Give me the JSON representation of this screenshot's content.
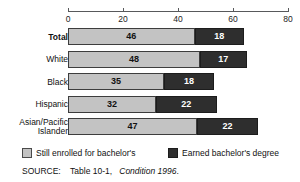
{
  "top_clipped_text": "",
  "chart_data": {
    "type": "bar",
    "orientation": "horizontal",
    "stacked": true,
    "title": "",
    "xlabel": "",
    "ylabel": "",
    "xlim": [
      0,
      80
    ],
    "grid": false,
    "xticks": [
      0,
      20,
      40,
      60,
      80
    ],
    "xtick_labels": [
      "0",
      "20",
      "40",
      "60",
      "80"
    ],
    "categories": [
      "Total",
      "White",
      "Black",
      "Hispanic",
      "Asian/Pacific Islander"
    ],
    "category_display": [
      "Total",
      "White",
      "Black",
      "Hispanic",
      "Asian/Pacific\nIslander"
    ],
    "series": [
      {
        "name": "Still enrolled for bachelor's",
        "color": "#c3c3c3",
        "values": [
          46,
          48,
          35,
          32,
          47
        ]
      },
      {
        "name": "Earned bachelor's degree",
        "color": "#2e2e2e",
        "values": [
          18,
          17,
          18,
          22,
          22
        ]
      }
    ],
    "legend_position": "bottom",
    "emphasis_category": "Total"
  },
  "legend": {
    "items": [
      {
        "label": "Still enrolled for bachelor's",
        "swatch": "light"
      },
      {
        "label": "Earned bachelor's degree",
        "swatch": "dark"
      }
    ]
  },
  "source": {
    "prefix": "SOURCE:",
    "table": "Table 10-1,",
    "publication": "Condition 1996",
    "suffix": "."
  }
}
